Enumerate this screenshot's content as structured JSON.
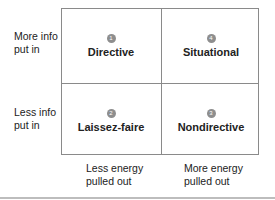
{
  "y_axis": {
    "top": "More info put in",
    "top_lines": [
      "More info",
      "put in"
    ],
    "bottom_lines": [
      "Less info",
      "put in"
    ]
  },
  "x_axis": {
    "left_lines": [
      "Less energy",
      "pulled out"
    ],
    "right_lines": [
      "More energy",
      "pulled out"
    ]
  },
  "quadrants": [
    {
      "position": "top-left",
      "number": "1",
      "label": "Directive"
    },
    {
      "position": "top-right",
      "number": "4",
      "label": "Situational"
    },
    {
      "position": "bottom-left",
      "number": "2",
      "label": "Laissez-faire"
    },
    {
      "position": "bottom-right",
      "number": "3",
      "label": "Nondirective"
    }
  ],
  "colors": {
    "border": "#8a8a8a",
    "badge": "#8e8e8e",
    "text": "#222222"
  }
}
